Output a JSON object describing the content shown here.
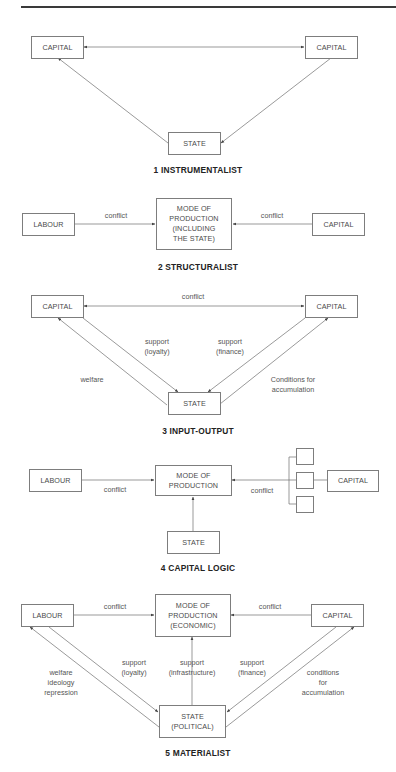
{
  "diagrams": [
    {
      "title": "1 INSTRUMENTALIST",
      "boxes": {
        "capital_left": "CAPITAL",
        "capital_right": "CAPITAL",
        "state": "STATE"
      }
    },
    {
      "title": "2 STRUCTURALIST",
      "boxes": {
        "labour": "LABOUR",
        "mode": "MODE OF\nPRODUCTION\n(INCLUDING\nTHE STATE)",
        "capital": "CAPITAL"
      },
      "labels": {
        "left": "conflict",
        "right": "conflict"
      }
    },
    {
      "title": "3 INPUT-OUTPUT",
      "boxes": {
        "capital_left": "CAPITAL",
        "capital_right": "CAPITAL",
        "state": "STATE"
      },
      "labels": {
        "top": "conflict",
        "loyalty": "support\n(loyalty)",
        "finance": "support\n(finance)",
        "welfare": "welfare",
        "conditions": "Conditions for\naccumulation"
      }
    },
    {
      "title": "4 CAPITAL LOGIC",
      "boxes": {
        "labour": "LABOUR",
        "mode": "MODE OF\nPRODUCTION",
        "capital": "CAPITAL",
        "state": "STATE"
      },
      "labels": {
        "left": "conflict",
        "right": "conflict"
      }
    },
    {
      "title": "5 MATERIALIST",
      "boxes": {
        "labour": "LABOUR",
        "mode": "MODE OF\nPRODUCTION\n(ECONOMIC)",
        "capital": "CAPITAL",
        "state": "STATE\n(POLITICAL)"
      },
      "labels": {
        "left": "conflict",
        "right": "conflict",
        "welfare": "welfare\nideology\nrepression",
        "loyalty": "support\n(loyalty)",
        "infrastructure": "support\n(infrastructure)",
        "finance": "support\n(finance)",
        "conditions": "conditions\nfor\naccumulation"
      }
    }
  ],
  "colors": {
    "line": "#6e6e6e",
    "border": "#7d7d7d",
    "text": "#4a4a4a",
    "title": "#222222",
    "rule": "#3a3a3a"
  }
}
